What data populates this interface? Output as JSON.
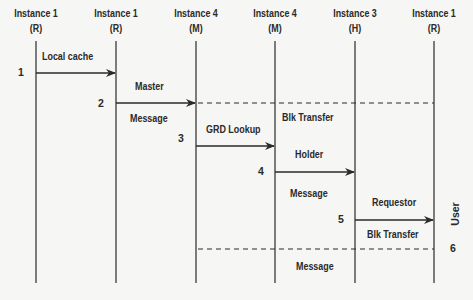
{
  "lifelines": [
    {
      "name": "Instance 1",
      "role": "(R)",
      "x": 36
    },
    {
      "name": "Instance 1",
      "role": "(R)",
      "x": 116
    },
    {
      "name": "Instance 4",
      "role": "(M)",
      "x": 196
    },
    {
      "name": "Instance 4",
      "role": "(M)",
      "x": 275
    },
    {
      "name": "Instance 3",
      "role": "(H)",
      "x": 355
    },
    {
      "name": "Instance 1",
      "role": "(R)",
      "x": 434
    }
  ],
  "steps": [
    {
      "num": "1",
      "above": "Local cache",
      "below": ""
    },
    {
      "num": "2",
      "above": "Master",
      "below": "Message"
    },
    {
      "num": "3",
      "above": "GRD Lookup",
      "below": ""
    },
    {
      "num": "4",
      "above": "Holder",
      "below": "Message"
    },
    {
      "num": "5",
      "above": "Requestor",
      "below": "Blk Transfer"
    },
    {
      "num": "6",
      "above": "",
      "below": "Message"
    }
  ],
  "dashed_labels": {
    "step2_transfer": "Blk Transfer"
  },
  "side_label": "User",
  "colors": {
    "line": "#2a2a2a",
    "background": "#f6f6f4"
  }
}
